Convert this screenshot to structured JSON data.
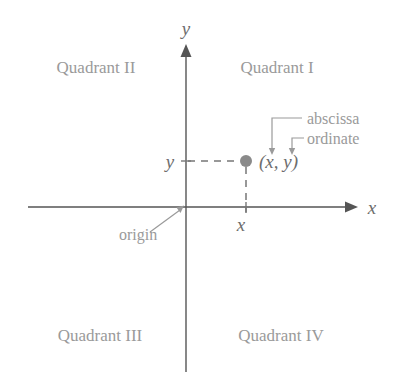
{
  "diagram": {
    "background_color": "#ffffff",
    "quadrants": [
      {
        "label": "Quadrant II",
        "name": "quadrant-2",
        "x": 96,
        "y": 73
      },
      {
        "label": "Quadrant I",
        "name": "quadrant-1",
        "x": 277,
        "y": 73
      },
      {
        "label": "Quadrant III",
        "name": "quadrant-3",
        "x": 100,
        "y": 341
      },
      {
        "label": "Quadrant IV",
        "name": "quadrant-4",
        "x": 281,
        "y": 341
      }
    ],
    "axes": {
      "origin": {
        "x": 186,
        "y": 207
      },
      "x_axis": {
        "label": "x",
        "label_x": 372,
        "label_y": 213,
        "start_x": 28,
        "end_x": 352,
        "color": "#555555"
      },
      "y_axis": {
        "label": "y",
        "label_x": 186,
        "label_y": 35,
        "start_y": 50,
        "end_y": 372,
        "color": "#555555"
      }
    },
    "point": {
      "label": "(x, y)",
      "dot_x": 246,
      "dot_y": 161,
      "dot_radius": 6,
      "dot_color": "#8a8a8a",
      "label_x": 259,
      "label_y": 168
    },
    "ticks": [
      {
        "label": "y",
        "name": "tick-label-y",
        "x": 170,
        "y": 168
      },
      {
        "label": "x",
        "name": "tick-label-x",
        "x": 241,
        "y": 230
      }
    ],
    "callouts": [
      {
        "label": "abscissa",
        "name": "abscissa",
        "text_x": 308,
        "text_y": 123
      },
      {
        "label": "ordinate",
        "name": "ordinate",
        "text_x": 308,
        "text_y": 143
      }
    ],
    "origin_callout": {
      "label": "origin",
      "text_x": 119,
      "text_y": 239
    },
    "colors": {
      "axis": "#555555",
      "guide": "#777777",
      "text_gray": "#9a9a9a",
      "variable_text": "#6d6d6d",
      "dot": "#8a8a8a"
    }
  }
}
